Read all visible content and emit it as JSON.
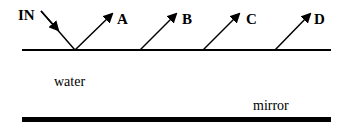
{
  "diagram": {
    "labels": {
      "incoming": "IN",
      "ray_a": "A",
      "ray_b": "B",
      "ray_c": "C",
      "ray_d": "D",
      "medium": "water",
      "reflector": "mirror"
    },
    "colors": {
      "ink": "#000000",
      "background": "#ffffff"
    }
  }
}
